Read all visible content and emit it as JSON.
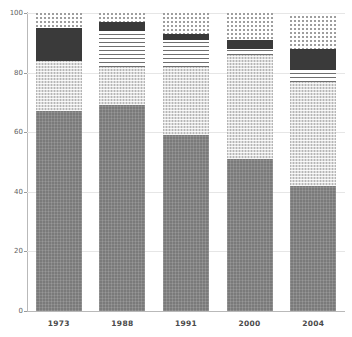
{
  "chart_data": {
    "type": "bar",
    "title": "",
    "subtitle": "",
    "xlabel": "",
    "ylabel": "",
    "stacked": true,
    "grid": true,
    "legend_position": "none",
    "ylim": [
      0,
      100
    ],
    "yticks": [
      "0",
      "20",
      "40",
      "60",
      "80",
      "100"
    ],
    "categories": [
      "1973",
      "1988",
      "1991",
      "2000",
      "2004"
    ],
    "series": [
      {
        "name": "segment-1-dark-gray-speckle",
        "pattern": "solid-gray-speckle",
        "color": "#7a7a7a",
        "values": [
          67,
          69,
          59,
          51,
          42
        ]
      },
      {
        "name": "segment-2-light-crosshatch",
        "pattern": "light-crosshatch",
        "color": "#dcdcdc",
        "values": [
          17,
          13,
          23,
          35,
          35
        ]
      },
      {
        "name": "segment-3-horizontal-stripes",
        "pattern": "horizontal-stripes",
        "color": "#6f6f6f",
        "values": [
          0,
          12,
          9,
          2,
          4
        ]
      },
      {
        "name": "segment-4-solid-dark",
        "pattern": "solid-dark",
        "color": "#3a3a3a",
        "values": [
          11,
          3,
          2,
          3,
          7
        ]
      },
      {
        "name": "segment-5-dots",
        "pattern": "dotted",
        "color": "#ffffff",
        "values": [
          5,
          3,
          7,
          9,
          11
        ]
      }
    ],
    "totals": [
      100,
      100,
      100,
      100,
      99
    ]
  },
  "axis": {
    "y_ticks": [
      {
        "label": "100",
        "value": 100
      },
      {
        "label": "80",
        "value": 80
      },
      {
        "label": "60",
        "value": 60
      },
      {
        "label": "40",
        "value": 40
      },
      {
        "label": "20",
        "value": 20
      },
      {
        "label": "0",
        "value": 0
      }
    ],
    "x_ticks": [
      {
        "label": "1973"
      },
      {
        "label": "1988"
      },
      {
        "label": "1991"
      },
      {
        "label": "2000"
      },
      {
        "label": "2004"
      }
    ]
  },
  "colors": {
    "grid": "#e6e6e6",
    "axis": "#b9b9b9",
    "tick_text": "#616161",
    "category_text": "#4a4a4a",
    "background": "#ffffff"
  }
}
